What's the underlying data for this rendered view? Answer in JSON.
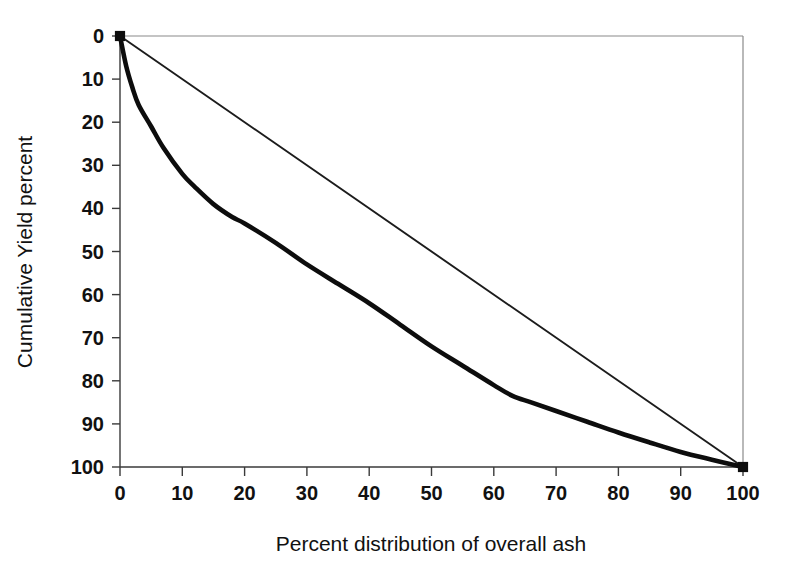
{
  "chart_data": {
    "type": "line",
    "title": "",
    "xlabel": "Percent distribution of overall ash",
    "ylabel": "Cumulative Yield percent",
    "xlim": [
      0,
      100
    ],
    "ylim": [
      0,
      100
    ],
    "y_axis_inverted": true,
    "grid": false,
    "legend": "none",
    "xticks": [
      "0",
      "10",
      "20",
      "30",
      "40",
      "50",
      "60",
      "70",
      "80",
      "90",
      "100"
    ],
    "yticks": [
      "0",
      "10",
      "20",
      "30",
      "40",
      "50",
      "60",
      "70",
      "80",
      "90",
      "100"
    ],
    "xtick_values": [
      0,
      10,
      20,
      30,
      40,
      50,
      60,
      70,
      80,
      90,
      100
    ],
    "ytick_values": [
      0,
      10,
      20,
      30,
      40,
      50,
      60,
      70,
      80,
      90,
      100
    ],
    "series": [
      {
        "name": "M-curve (washability curve)",
        "style": "thick-solid-line",
        "color": "#0d0d0d",
        "linewidth": 4.6,
        "x": [
          0,
          1,
          2,
          3,
          5,
          7,
          10,
          12,
          15,
          18,
          20,
          25,
          30,
          35,
          40,
          45,
          50,
          55,
          60,
          63,
          66,
          70,
          75,
          80,
          85,
          90,
          95,
          100
        ],
        "y": [
          0,
          7,
          12,
          16,
          21,
          26,
          32,
          35,
          39,
          42,
          43.5,
          48,
          53,
          57.5,
          62,
          67,
          72,
          76.5,
          81,
          83.5,
          85,
          87,
          89.5,
          92,
          94.3,
          96.5,
          98.3,
          100
        ]
      },
      {
        "name": "Equal distribution diagonal",
        "style": "thin-solid-line",
        "color": "#1c1c1c",
        "linewidth": 1.9,
        "x": [
          0,
          100
        ],
        "y": [
          0,
          100
        ]
      }
    ],
    "endpoints": [
      {
        "x": 0,
        "y": 0,
        "marker": "small-square"
      },
      {
        "x": 100,
        "y": 100,
        "marker": "small-square"
      }
    ],
    "plot_border": {
      "top": true,
      "right": true,
      "left": true,
      "bottom": true
    }
  }
}
